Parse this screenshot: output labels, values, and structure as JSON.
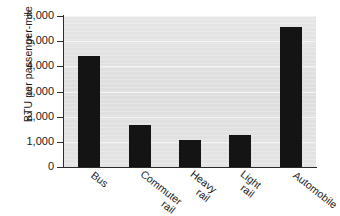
{
  "chart_data": {
    "type": "bar",
    "title": "",
    "xlabel": "",
    "ylabel": "BTU per passenger-mile",
    "categories": [
      "Bus",
      "Commuter rail",
      "Heavy rail",
      "Light rail",
      "Automobile"
    ],
    "category_lines": [
      [
        "Bus"
      ],
      [
        "Commuter",
        "rail"
      ],
      [
        "Heavy",
        "rail"
      ],
      [
        "Light",
        "rail"
      ],
      [
        "Automobile"
      ]
    ],
    "values": [
      4400,
      1670,
      1070,
      1270,
      5560
    ],
    "ylim": [
      0,
      6000
    ],
    "ytick_values": [
      0,
      1000,
      2000,
      3000,
      4000,
      5000,
      6000
    ],
    "ytick_labels": [
      "0",
      "1,000",
      "2,000",
      "3,000",
      "4,000",
      "5,000",
      "6,000"
    ],
    "grid": true,
    "legend": null,
    "legend_position": "none",
    "bar_color": "#141414",
    "plot_background": "#e2e2e2",
    "gridline_color": "#f4f4f4",
    "axis_color": "#2b2b2b"
  }
}
